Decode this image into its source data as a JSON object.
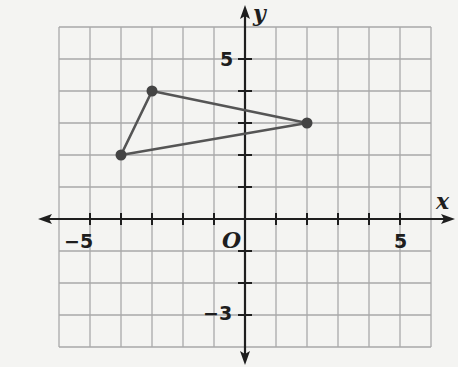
{
  "chart_data": {
    "type": "scatter",
    "subtype": "coordinate-plane-polygon",
    "title": "",
    "xlabel": "x",
    "ylabel": "y",
    "origin_label": "O",
    "xlim": [
      -6,
      6
    ],
    "ylim": [
      -4,
      6
    ],
    "grid": true,
    "grid_step": 1,
    "x_tick_labels": [
      {
        "value": -5,
        "label": "−5"
      },
      {
        "value": 5,
        "label": "5"
      }
    ],
    "y_tick_labels": [
      {
        "value": 5,
        "label": "5"
      },
      {
        "value": -3,
        "label": "−3"
      }
    ],
    "series": [
      {
        "name": "triangle",
        "closed": true,
        "points": [
          {
            "x": -4,
            "y": 2
          },
          {
            "x": -3,
            "y": 4
          },
          {
            "x": 2,
            "y": 3
          }
        ]
      }
    ],
    "colors": {
      "background": "#f4f4f2",
      "grid": "#a9a9a9",
      "axis": "#1e1e1e",
      "polygon": "#555555",
      "vertex": "#444444"
    }
  },
  "labels": {
    "x_axis": "x",
    "y_axis": "y",
    "origin": "O",
    "x_neg5": "−5",
    "x_pos5": "5",
    "y_pos5": "5",
    "y_neg3": "−3"
  }
}
